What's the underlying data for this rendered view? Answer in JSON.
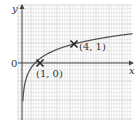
{
  "chart_data": {
    "type": "line",
    "title": "",
    "xlabel": "x",
    "ylabel": "y",
    "origin_label": "0",
    "function": "y = log_4(x)",
    "xlim": [
      0,
      8.5
    ],
    "ylim": [
      -3,
      3
    ],
    "grid": true,
    "series": [
      {
        "name": "curve",
        "x": [
          0.06,
          0.1,
          0.2,
          0.4,
          0.7,
          1,
          1.5,
          2,
          3,
          4,
          5,
          6,
          7,
          8.5
        ],
        "y": [
          -2.03,
          -1.66,
          -1.16,
          -0.66,
          -0.26,
          0,
          0.29,
          0.5,
          0.79,
          1,
          1.16,
          1.29,
          1.4,
          1.54
        ]
      }
    ],
    "points": [
      {
        "x": 1,
        "y": 0,
        "label": "(1, 0)",
        "marker": "cross"
      },
      {
        "x": 4,
        "y": 1,
        "label": "(4, 1)",
        "marker": "cross"
      }
    ]
  },
  "colors": {
    "grid": "#c8c8c8",
    "axis": "#444444",
    "curve": "#555555"
  }
}
